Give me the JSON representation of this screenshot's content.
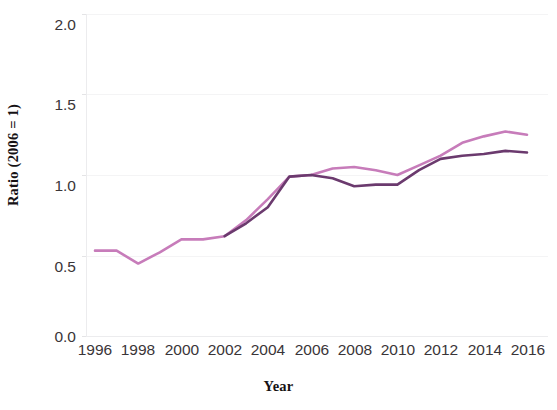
{
  "chart_data": {
    "type": "line",
    "title": "",
    "xlabel": "Year",
    "ylabel": "Ratio (2006 = 1)",
    "xlim": [
      1996,
      2016
    ],
    "ylim": [
      0.0,
      2.0
    ],
    "grid": true,
    "legend_position": "none",
    "x_tick_labels": [
      "1996",
      "1998",
      "2000",
      "2002",
      "2004",
      "2006",
      "2008",
      "2010",
      "2012",
      "2014",
      "2016"
    ],
    "x_tick_values": [
      1996,
      1998,
      2000,
      2002,
      2004,
      2006,
      2008,
      2010,
      2012,
      2014,
      2016
    ],
    "y_tick_labels": [
      "0.0",
      "0.5",
      "1.0",
      "1.5",
      "2.0"
    ],
    "y_tick_values": [
      0.0,
      0.5,
      1.0,
      1.5,
      2.0
    ],
    "x": [
      1996,
      1997,
      1998,
      1999,
      2000,
      2001,
      2002,
      2003,
      2004,
      2005,
      2006,
      2007,
      2008,
      2009,
      2010,
      2011,
      2012,
      2013,
      2014,
      2015,
      2016
    ],
    "series": [
      {
        "name": "series-light-pink",
        "color": "#c77cba",
        "values": [
          0.53,
          0.53,
          0.45,
          0.52,
          0.6,
          0.6,
          0.62,
          0.72,
          0.85,
          0.99,
          1.0,
          1.04,
          1.05,
          1.03,
          1.0,
          1.06,
          1.12,
          1.2,
          1.24,
          1.27,
          1.25
        ]
      },
      {
        "name": "series-dark-purple",
        "color": "#6b3a6e",
        "values": [
          null,
          null,
          null,
          null,
          null,
          null,
          0.62,
          0.7,
          0.8,
          0.99,
          1.0,
          0.98,
          0.93,
          0.94,
          0.94,
          1.03,
          1.1,
          1.12,
          1.13,
          1.15,
          1.14
        ]
      }
    ]
  },
  "styles": {
    "background": "#ffffff",
    "grid_color": "#f4f4f5",
    "axis_color": "#ececee",
    "tick_text_color": "#3a3538",
    "axis_title_color": "#161214"
  }
}
